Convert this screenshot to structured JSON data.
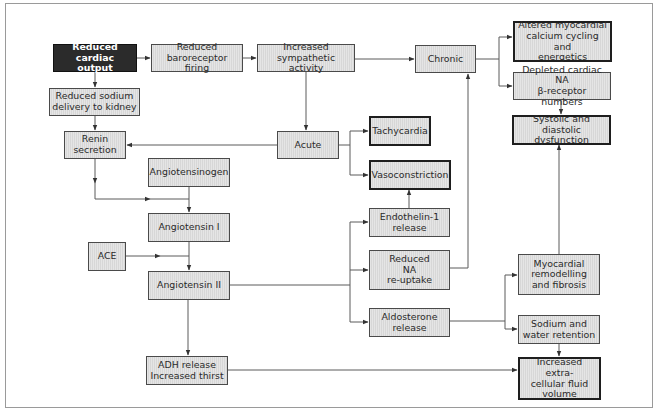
{
  "diagram": {
    "colors": {
      "box_fill": "#d7d7d7",
      "box_border": "#4a4a4a",
      "emphasis_border": "#1e1e1e",
      "start_fill": "#2b2b2b",
      "start_text": "#ffffff",
      "connector": "#555555",
      "frame": "#9a9a9a"
    },
    "nodes": {
      "reduced_cardiac_output": "Reduced cardiac\noutput",
      "reduced_baroreceptor": "Reduced\nbaroreceptor firing",
      "increased_sympathetic": "Increased\nsympathetic activity",
      "chronic": "Chronic",
      "altered_myocardial": "Altered myocardial\ncalcium cycling and\nenergetics",
      "depleted_na": "Depleted cardiac NA\nβ-receptor numbers",
      "systolic_diastolic": "Systolic and diastolic\ndysfunction",
      "reduced_sodium": "Reduced sodium\ndelivery to kidney",
      "renin": "Renin\nsecretion",
      "acute": "Acute",
      "tachycardia": "Tachycardia",
      "vasoconstriction": "Vasoconstriction",
      "angiotensinogen": "Angiotensinogen",
      "angiotensin_1": "Angiotensin I",
      "ace": "ACE",
      "angiotensin_2": "Angiotensin II",
      "endothelin": "Endothelin-1\nrelease",
      "reduced_na_reuptake": "Reduced\nNA\nre-uptake",
      "aldosterone": "Aldosterone\nrelease",
      "myocardial_remodelling": "Myocardial\nremodelling\nand fibrosis",
      "sodium_water": "Sodium and\nwater retention",
      "adh": "ADH release\nIncreased thirst",
      "increased_ecf": "Increased extra-\ncellular fluid\nvolume"
    },
    "edges": [
      [
        "reduced_cardiac_output",
        "reduced_baroreceptor"
      ],
      [
        "reduced_baroreceptor",
        "increased_sympathetic"
      ],
      [
        "increased_sympathetic",
        "chronic"
      ],
      [
        "increased_sympathetic",
        "acute"
      ],
      [
        "chronic",
        "altered_myocardial"
      ],
      [
        "chronic",
        "depleted_na"
      ],
      [
        "depleted_na",
        "systolic_diastolic"
      ],
      [
        "reduced_cardiac_output",
        "reduced_sodium"
      ],
      [
        "reduced_sodium",
        "renin"
      ],
      [
        "acute",
        "renin"
      ],
      [
        "acute",
        "tachycardia"
      ],
      [
        "acute",
        "vasoconstriction"
      ],
      [
        "renin",
        "angiotensin_1"
      ],
      [
        "angiotensinogen",
        "angiotensin_1"
      ],
      [
        "angiotensin_1",
        "angiotensin_2"
      ],
      [
        "ace",
        "angiotensin_2"
      ],
      [
        "angiotensin_2",
        "endothelin"
      ],
      [
        "angiotensin_2",
        "reduced_na_reuptake"
      ],
      [
        "angiotensin_2",
        "aldosterone"
      ],
      [
        "angiotensin_2",
        "adh"
      ],
      [
        "endothelin",
        "vasoconstriction"
      ],
      [
        "reduced_na_reuptake",
        "chronic"
      ],
      [
        "aldosterone",
        "myocardial_remodelling"
      ],
      [
        "aldosterone",
        "sodium_water"
      ],
      [
        "myocardial_remodelling",
        "systolic_diastolic"
      ],
      [
        "sodium_water",
        "increased_ecf"
      ],
      [
        "adh",
        "increased_ecf"
      ]
    ]
  }
}
